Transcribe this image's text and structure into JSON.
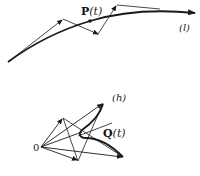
{
  "figure": {
    "top": {
      "curve_label": "(l)",
      "point_label_main": "P",
      "point_label_arg": "(t)"
    },
    "bottom": {
      "curve_label": "(h)",
      "point_label_main": "Q",
      "point_label_arg": "(t)",
      "origin_label": "0"
    }
  },
  "colors": {
    "ink": "#1a1a1a",
    "background": "#ffffff"
  }
}
